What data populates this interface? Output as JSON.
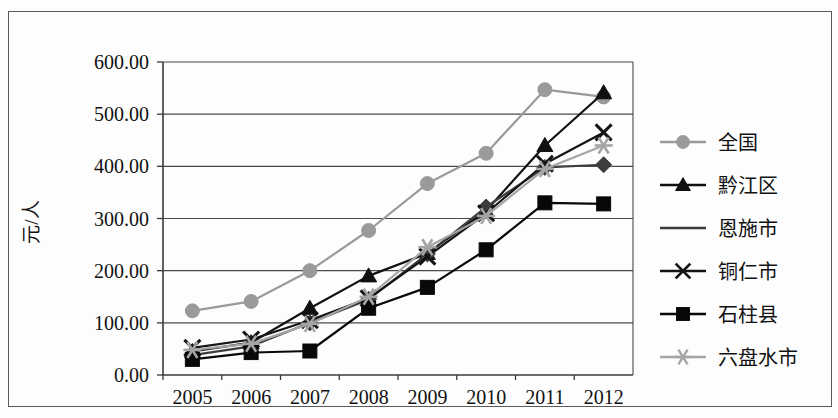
{
  "figure": {
    "y_axis_title": "元/人",
    "x_tick_labels": [
      "2005",
      "2006",
      "2007",
      "2008",
      "2009",
      "2010",
      "2011",
      "2012"
    ],
    "y_tick_labels": [
      "0.00",
      "100.00",
      "200.00",
      "300.00",
      "400.00",
      "500.00",
      "600.00"
    ]
  },
  "legend": {
    "items": [
      {
        "label": "全国",
        "marker": "circle",
        "color": "#9a9a9a"
      },
      {
        "label": "黔江区",
        "marker": "triangle",
        "color": "#101010"
      },
      {
        "label": "恩施市",
        "marker": "none",
        "color": "#3d3d3d"
      },
      {
        "label": "铜仁市",
        "marker": "cross",
        "color": "#141414"
      },
      {
        "label": "石柱县",
        "marker": "square",
        "color": "#080808"
      },
      {
        "label": "六盘水市",
        "marker": "asterisk",
        "color": "#a5a5a5"
      }
    ]
  },
  "chart_data": {
    "type": "line",
    "title": "",
    "xlabel": "",
    "ylabel": "元/人",
    "categories": [
      "2005",
      "2006",
      "2007",
      "2008",
      "2009",
      "2010",
      "2011",
      "2012"
    ],
    "ylim": [
      0,
      600
    ],
    "ytick_step": 100,
    "grid": true,
    "legend_position": "right",
    "series": [
      {
        "name": "全国",
        "marker": "circle",
        "color": "#9a9a9a",
        "values": [
          123.0,
          141.0,
          200.0,
          277.0,
          367.0,
          425.0,
          547.0,
          533.0
        ]
      },
      {
        "name": "黔江区",
        "marker": "triangle",
        "color": "#101010",
        "values": [
          45.0,
          62.0,
          128.0,
          190.0,
          233.0,
          315.0,
          440.0,
          541.0
        ]
      },
      {
        "name": "恩施市",
        "marker": "diamond",
        "color": "#3d3d3d",
        "values": [
          38.0,
          55.0,
          100.0,
          145.0,
          232.0,
          322.0,
          398.0,
          403.0
        ]
      },
      {
        "name": "铜仁市",
        "marker": "cross",
        "color": "#141414",
        "values": [
          52.0,
          68.0,
          105.0,
          147.0,
          227.0,
          310.0,
          405.0,
          465.0
        ]
      },
      {
        "name": "石柱县",
        "marker": "square",
        "color": "#080808",
        "values": [
          30.0,
          43.0,
          46.0,
          128.0,
          168.0,
          240.0,
          330.0,
          328.0
        ]
      },
      {
        "name": "六盘水市",
        "marker": "asterisk",
        "color": "#a5a5a5",
        "values": [
          48.0,
          60.0,
          98.0,
          150.0,
          245.0,
          305.0,
          395.0,
          440.0
        ]
      }
    ]
  }
}
